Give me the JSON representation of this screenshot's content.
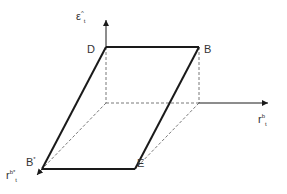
{
  "diagram": {
    "type": "3d-axes-parallelogram",
    "axes": {
      "vertical": {
        "symbol": "ε",
        "sup": "^",
        "sub": "t"
      },
      "horizontal": {
        "symbol": "r",
        "sup": "b",
        "sub": "t"
      },
      "depth": {
        "symbol": "r",
        "sup": "b*",
        "sub": "t"
      }
    },
    "points": {
      "D": "D",
      "B": "B",
      "B_star": "B",
      "B_star_sup": "*",
      "E": "E"
    },
    "colors": {
      "line": "#1a1a1a",
      "dashed": "#555555",
      "background": "#ffffff"
    }
  }
}
